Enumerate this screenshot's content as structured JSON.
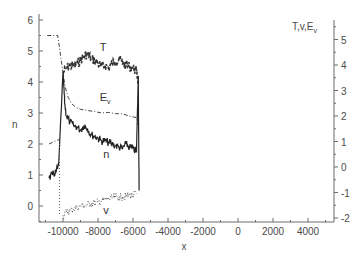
{
  "chart_data": {
    "type": "line",
    "title": "",
    "xlabel": "x",
    "ylabel": "n",
    "ylabel_right": "T,v,E_v",
    "xlim": [
      -11400,
      5500
    ],
    "ylim": [
      -0.5,
      6.1
    ],
    "ylim_right": [
      -2.1,
      5.8
    ],
    "grid": false,
    "legend": "inline curve labels",
    "x_ticks": [
      -10000,
      -8000,
      -6000,
      -4000,
      -2000,
      0,
      2000,
      4000
    ],
    "x_tick_labels": [
      "-10000",
      "-8000",
      "-6000",
      "-4000",
      "-2000",
      "0",
      "2000",
      "4000"
    ],
    "y_ticks": [
      0,
      1,
      2,
      3,
      4,
      5,
      6
    ],
    "y_tick_labels": [
      "0",
      "1",
      "2",
      "3",
      "4",
      "5",
      "6"
    ],
    "y_right_ticks": [
      -2,
      -1,
      0,
      1,
      2,
      3,
      4,
      5
    ],
    "y_right_tick_labels": [
      "-2",
      "-1",
      "0",
      "1",
      "2",
      "3",
      "4",
      "5"
    ],
    "annotations": [
      {
        "text": "T",
        "x": -7900,
        "y": 5.0
      },
      {
        "text": "E",
        "sub": "v",
        "x": -7900,
        "y": 3.4
      },
      {
        "text": "n",
        "x": -7700,
        "y": 1.55
      },
      {
        "text": "v",
        "x": -7700,
        "y": -0.25
      }
    ],
    "series": [
      {
        "name": "T",
        "style": "dashed-noisy",
        "axis": "left-scale",
        "x": [
          -10000,
          -9800,
          -9600,
          -9400,
          -9200,
          -9000,
          -8800,
          -8600,
          -8400,
          -8200,
          -8000,
          -7800,
          -7600,
          -7400,
          -7200,
          -7000,
          -6800,
          -6600,
          -6400,
          -6200,
          -6000,
          -5800,
          -5700
        ],
        "values": [
          4.3,
          4.45,
          4.55,
          4.5,
          4.6,
          4.7,
          4.85,
          4.9,
          4.75,
          4.7,
          4.6,
          4.5,
          4.55,
          4.45,
          4.6,
          4.65,
          4.75,
          4.6,
          4.55,
          4.5,
          4.45,
          4.35,
          4.0
        ]
      },
      {
        "name": "E_v",
        "style": "dash-dot",
        "axis": "left-scale",
        "x": [
          -10900,
          -10300,
          -10250,
          -10000,
          -9900,
          -9700,
          -9500,
          -9300,
          -9000,
          -8600,
          -8200,
          -7800,
          -7400,
          -7000,
          -6600,
          -6200,
          -5800,
          -5700
        ],
        "values": [
          5.5,
          5.5,
          5.3,
          4.3,
          3.9,
          3.5,
          3.3,
          3.2,
          3.12,
          3.08,
          3.05,
          3.0,
          3.02,
          2.98,
          2.97,
          2.9,
          2.85,
          2.6
        ]
      },
      {
        "name": "E_v (pre-shock)",
        "style": "dash-dot",
        "axis": "left-scale",
        "x": [
          -10800,
          -10600,
          -10400,
          -10200
        ],
        "values": [
          2.0,
          2.05,
          2.1,
          2.15
        ]
      },
      {
        "name": "n",
        "style": "solid-noisy",
        "axis": "left-scale",
        "x": [
          -10800,
          -10600,
          -10400,
          -10250,
          -10000,
          -9950,
          -9900,
          -9800,
          -9600,
          -9400,
          -9200,
          -9000,
          -8800,
          -8600,
          -8400,
          -8200,
          -8000,
          -7800,
          -7600,
          -7400,
          -7200,
          -7000,
          -6800,
          -6600,
          -6400,
          -6200,
          -6000,
          -5800,
          -5700,
          -5650
        ],
        "values": [
          0.9,
          1.0,
          1.1,
          1.3,
          4.3,
          3.8,
          3.3,
          2.9,
          2.7,
          2.6,
          2.55,
          2.45,
          2.6,
          2.5,
          2.3,
          2.25,
          2.2,
          2.1,
          2.1,
          2.05,
          2.0,
          1.95,
          1.9,
          1.85,
          2.0,
          1.9,
          1.85,
          1.75,
          4.2,
          0.5
        ]
      },
      {
        "name": "v",
        "style": "dotted",
        "axis": "left-scale",
        "x": [
          -10000,
          -9800,
          -9600,
          -9400,
          -9200,
          -9000,
          -8800,
          -8600,
          -8400,
          -8200,
          -8000,
          -7800,
          -7600,
          -7400,
          -7200,
          -7000,
          -6800,
          -6600,
          -6400,
          -6200,
          -6000,
          -5800
        ],
        "values": [
          -0.3,
          -0.2,
          -0.15,
          -0.1,
          -0.05,
          0.0,
          0.02,
          0.05,
          0.08,
          0.1,
          0.12,
          0.15,
          0.2,
          0.22,
          0.25,
          0.3,
          0.28,
          0.3,
          0.32,
          0.35,
          0.33,
          0.4
        ]
      },
      {
        "name": "shock front",
        "style": "dotted-vertical",
        "axis": "left-scale",
        "x": [
          -10200,
          -10200
        ],
        "values": [
          2.0,
          -0.3
        ]
      }
    ]
  }
}
